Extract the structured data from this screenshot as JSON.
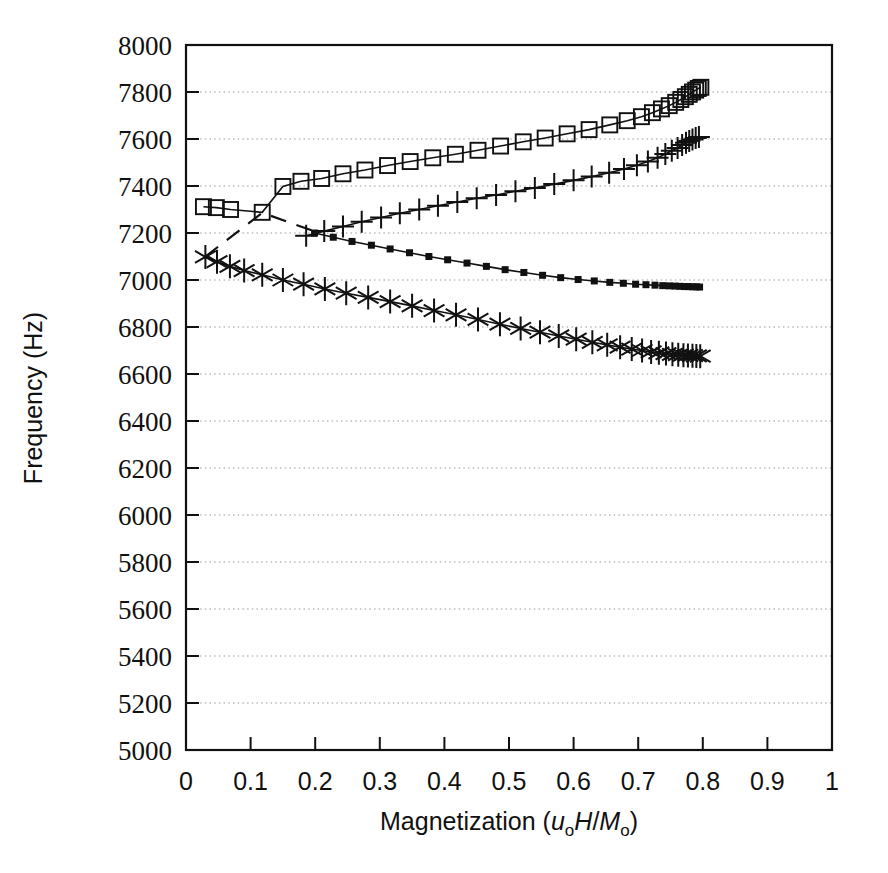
{
  "figure": {
    "background": "#ffffff",
    "ink_color": "#111111",
    "grid_color": "#999999"
  },
  "axes": {
    "x_title_parts": {
      "main": "Magnetization (",
      "italic1": "u",
      "sub1": "o",
      "italic2": "H",
      "slash": "/",
      "italic3": "M",
      "sub2": "o",
      "close": ")"
    },
    "x_title_plain": "Magnetization (uoH/Mo)",
    "y_title": "Frequency (Hz)",
    "x_ticks": [
      "0",
      "0.1",
      "0.2",
      "0.3",
      "0.4",
      "0.5",
      "0.6",
      "0.7",
      "0.8",
      "0.9",
      "1"
    ],
    "x_tick_values": [
      0,
      0.1,
      0.2,
      0.3,
      0.4,
      0.5,
      0.6,
      0.7,
      0.8,
      0.9,
      1
    ],
    "y_ticks": [
      "5000",
      "5200",
      "5400",
      "5600",
      "5800",
      "6000",
      "6200",
      "6400",
      "6600",
      "6800",
      "7000",
      "7200",
      "7400",
      "7600",
      "7800",
      "8000"
    ],
    "y_tick_values": [
      5000,
      5200,
      5400,
      5600,
      5800,
      6000,
      6200,
      6400,
      6600,
      6800,
      7000,
      7200,
      7400,
      7600,
      7800,
      8000
    ]
  },
  "chart_data": {
    "type": "line",
    "title": "",
    "xlabel": "Magnetization (uoH/Mo)",
    "ylabel": "Frequency (Hz)",
    "xlim": [
      0,
      1
    ],
    "ylim": [
      5000,
      8000
    ],
    "grid": "horizontal-dotted",
    "legend": "none",
    "series": [
      {
        "name": "open-squares",
        "marker": "open-square",
        "points": [
          [
            0.027,
            7312
          ],
          [
            0.047,
            7308
          ],
          [
            0.069,
            7300
          ],
          [
            0.118,
            7288
          ],
          [
            0.15,
            7398
          ],
          [
            0.178,
            7420
          ],
          [
            0.21,
            7432
          ],
          [
            0.243,
            7452
          ],
          [
            0.277,
            7468
          ],
          [
            0.312,
            7487
          ],
          [
            0.347,
            7504
          ],
          [
            0.382,
            7520
          ],
          [
            0.417,
            7535
          ],
          [
            0.452,
            7552
          ],
          [
            0.487,
            7570
          ],
          [
            0.522,
            7588
          ],
          [
            0.556,
            7604
          ],
          [
            0.59,
            7622
          ],
          [
            0.624,
            7640
          ],
          [
            0.656,
            7660
          ],
          [
            0.683,
            7678
          ],
          [
            0.705,
            7695
          ],
          [
            0.722,
            7712
          ],
          [
            0.736,
            7728
          ],
          [
            0.748,
            7742
          ],
          [
            0.758,
            7756
          ],
          [
            0.766,
            7768
          ],
          [
            0.773,
            7780
          ],
          [
            0.779,
            7790
          ],
          [
            0.784,
            7800
          ],
          [
            0.789,
            7808
          ],
          [
            0.793,
            7815
          ],
          [
            0.797,
            7820
          ]
        ]
      },
      {
        "name": "plus-markers",
        "marker": "plus",
        "points": [
          [
            0.186,
            7188
          ],
          [
            0.214,
            7208
          ],
          [
            0.243,
            7228
          ],
          [
            0.272,
            7248
          ],
          [
            0.302,
            7266
          ],
          [
            0.331,
            7284
          ],
          [
            0.361,
            7300
          ],
          [
            0.39,
            7316
          ],
          [
            0.42,
            7332
          ],
          [
            0.45,
            7348
          ],
          [
            0.48,
            7362
          ],
          [
            0.51,
            7378
          ],
          [
            0.54,
            7392
          ],
          [
            0.57,
            7408
          ],
          [
            0.6,
            7424
          ],
          [
            0.628,
            7440
          ],
          [
            0.655,
            7456
          ],
          [
            0.678,
            7472
          ],
          [
            0.698,
            7488
          ],
          [
            0.715,
            7504
          ],
          [
            0.73,
            7520
          ],
          [
            0.742,
            7536
          ],
          [
            0.752,
            7550
          ],
          [
            0.761,
            7562
          ],
          [
            0.768,
            7574
          ],
          [
            0.774,
            7584
          ],
          [
            0.779,
            7592
          ],
          [
            0.784,
            7598
          ],
          [
            0.789,
            7604
          ],
          [
            0.794,
            7608
          ]
        ]
      },
      {
        "name": "filled-squares",
        "marker": "filled-square",
        "points": [
          [
            0.199,
            7200
          ],
          [
            0.228,
            7182
          ],
          [
            0.257,
            7164
          ],
          [
            0.287,
            7148
          ],
          [
            0.316,
            7132
          ],
          [
            0.346,
            7116
          ],
          [
            0.376,
            7100
          ],
          [
            0.405,
            7086
          ],
          [
            0.435,
            7072
          ],
          [
            0.465,
            7058
          ],
          [
            0.494,
            7044
          ],
          [
            0.523,
            7032
          ],
          [
            0.552,
            7020
          ],
          [
            0.58,
            7010
          ],
          [
            0.607,
            7002
          ],
          [
            0.632,
            6996
          ],
          [
            0.656,
            6990
          ],
          [
            0.677,
            6986
          ],
          [
            0.696,
            6982
          ],
          [
            0.712,
            6980
          ],
          [
            0.726,
            6978
          ],
          [
            0.738,
            6976
          ],
          [
            0.748,
            6975
          ],
          [
            0.757,
            6974
          ],
          [
            0.765,
            6973
          ],
          [
            0.772,
            6972
          ],
          [
            0.778,
            6972
          ],
          [
            0.784,
            6971
          ],
          [
            0.79,
            6971
          ],
          [
            0.795,
            6970
          ]
        ]
      },
      {
        "name": "asterisks",
        "marker": "asterisk",
        "points": [
          [
            0.03,
            7098
          ],
          [
            0.048,
            7078
          ],
          [
            0.068,
            7058
          ],
          [
            0.09,
            7040
          ],
          [
            0.118,
            7022
          ],
          [
            0.15,
            7000
          ],
          [
            0.182,
            6982
          ],
          [
            0.215,
            6962
          ],
          [
            0.248,
            6944
          ],
          [
            0.282,
            6926
          ],
          [
            0.316,
            6908
          ],
          [
            0.35,
            6890
          ],
          [
            0.384,
            6870
          ],
          [
            0.418,
            6852
          ],
          [
            0.452,
            6832
          ],
          [
            0.486,
            6812
          ],
          [
            0.518,
            6794
          ],
          [
            0.548,
            6778
          ],
          [
            0.577,
            6762
          ],
          [
            0.604,
            6748
          ],
          [
            0.629,
            6735
          ],
          [
            0.652,
            6724
          ],
          [
            0.672,
            6714
          ],
          [
            0.69,
            6706
          ],
          [
            0.706,
            6700
          ],
          [
            0.72,
            6694
          ],
          [
            0.732,
            6690
          ],
          [
            0.743,
            6687
          ],
          [
            0.753,
            6684
          ],
          [
            0.762,
            6682
          ],
          [
            0.77,
            6680
          ],
          [
            0.777,
            6679
          ],
          [
            0.784,
            6678
          ],
          [
            0.79,
            6677
          ],
          [
            0.796,
            6676
          ]
        ]
      }
    ],
    "annotations": [
      {
        "name": "dashed-guide-line",
        "style": "dashed",
        "points": [
          [
            0.03,
            7100
          ],
          [
            0.118,
            7286
          ],
          [
            0.21,
            7196
          ]
        ]
      }
    ]
  }
}
